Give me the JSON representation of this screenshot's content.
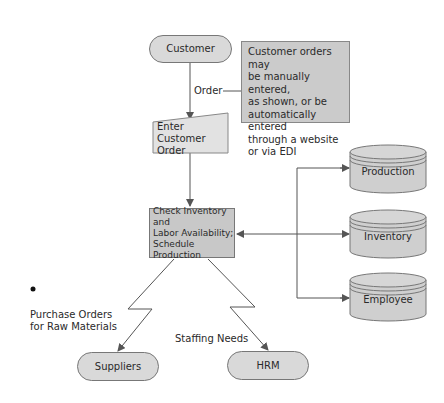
{
  "diagram": {
    "type": "flowchart",
    "nodes": {
      "customer": {
        "label": "Customer",
        "shape": "terminator"
      },
      "enter_order": {
        "label": "Enter Customer\nOrder",
        "shape": "manual-input"
      },
      "check": {
        "label": "Check Inventory and\nLabor Availability;\nSchedule Production",
        "shape": "process"
      },
      "suppliers": {
        "label": "Suppliers",
        "shape": "terminator"
      },
      "hrm": {
        "label": "HRM",
        "shape": "terminator"
      },
      "db_production": {
        "label": "Production",
        "shape": "database"
      },
      "db_inventory": {
        "label": "Inventory",
        "shape": "database"
      },
      "db_employee": {
        "label": "Employee",
        "shape": "database"
      }
    },
    "annotation": {
      "text": "Customer orders may\nbe manually entered,\nas shown, or be\nautomatically entered\nthrough a website\nor via EDI"
    },
    "edge_labels": {
      "order": "Order",
      "purchase_orders": "Purchase Orders\nfor Raw Materials",
      "staffing": "Staffing Needs"
    },
    "colors": {
      "shape_fill": "#d9d9d9",
      "process_fill": "#c8c8c8",
      "line": "#555555"
    }
  }
}
